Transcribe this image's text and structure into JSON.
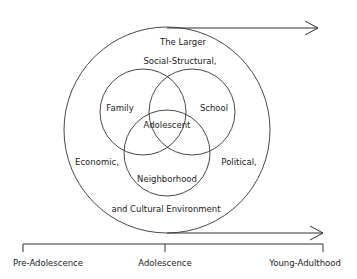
{
  "diagram": {
    "outer_labels": {
      "top_line1": "The Larger",
      "top_line2": "Social-Structural,",
      "left": "Economic,",
      "right": "Political,",
      "bottom": "and Cultural Environment"
    },
    "circles": {
      "family": "Family",
      "school": "School",
      "neighborhood": "Neighborhood",
      "center": "Adolescent"
    },
    "timeline": {
      "start": "Pre-Adolescence",
      "middle": "Adolescence",
      "end": "Young-Adulthood"
    },
    "colors": {
      "stroke": "#333333",
      "text": "#222222"
    }
  }
}
